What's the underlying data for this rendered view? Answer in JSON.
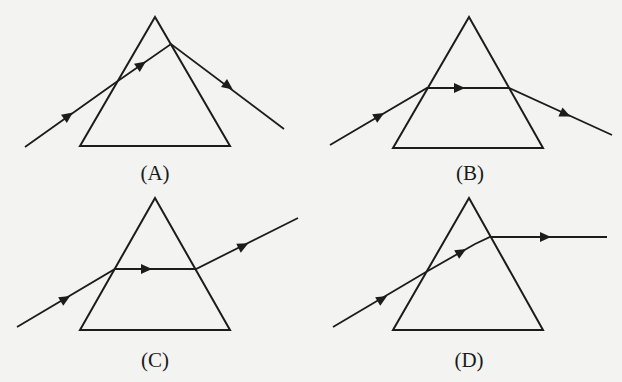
{
  "diagram": {
    "type": "prism-ray-refraction-options",
    "colors": {
      "background": "#f3f3f1",
      "ink": "#1c1c1c"
    },
    "panels": [
      {
        "id": "A",
        "label": "(A)",
        "label_pos": [
          155,
          180
        ],
        "prism": [
          [
            155,
            17
          ],
          [
            80,
            146
          ],
          [
            230,
            146
          ]
        ],
        "ray": [
          [
            25,
            147
          ],
          [
            115,
            83
          ],
          [
            171,
            44
          ],
          [
            284,
            129
          ]
        ],
        "arrows": [
          {
            "at": [
              68,
              116
            ],
            "dir": [
              90,
              -64
            ]
          },
          {
            "at": [
              141,
              65
            ],
            "dir": [
              56,
              -39
            ]
          },
          {
            "at": [
              228,
              86
            ],
            "dir": [
              113,
              85
            ]
          }
        ]
      },
      {
        "id": "B",
        "label": "(B)",
        "label_pos": [
          470,
          180
        ],
        "prism": [
          [
            469,
            17
          ],
          [
            393,
            148
          ],
          [
            543,
            148
          ]
        ],
        "ray": [
          [
            330,
            145
          ],
          [
            427,
            88
          ],
          [
            509,
            88
          ],
          [
            612,
            135
          ]
        ],
        "arrows": [
          {
            "at": [
              379,
              116
            ],
            "dir": [
              97,
              -57
            ]
          },
          {
            "at": [
              459,
              88
            ],
            "dir": [
              1,
              0
            ]
          },
          {
            "at": [
              565,
              114
            ],
            "dir": [
              103,
              47
            ]
          }
        ]
      },
      {
        "id": "C",
        "label": "(C)",
        "label_pos": [
          155,
          367
        ],
        "prism": [
          [
            155,
            198
          ],
          [
            80,
            330
          ],
          [
            230,
            330
          ]
        ],
        "ray": [
          [
            17,
            327
          ],
          [
            115,
            269
          ],
          [
            196,
            269
          ],
          [
            298,
            218
          ]
        ],
        "arrows": [
          {
            "at": [
              65,
              299
            ],
            "dir": [
              98,
              -58
            ]
          },
          {
            "at": [
              146,
              269
            ],
            "dir": [
              1,
              0
            ]
          },
          {
            "at": [
              243,
              246
            ],
            "dir": [
              102,
              -51
            ]
          }
        ]
      },
      {
        "id": "D",
        "label": "(D)",
        "label_pos": [
          469,
          367
        ],
        "prism": [
          [
            469,
            198
          ],
          [
            393,
            330
          ],
          [
            543,
            330
          ]
        ],
        "ray": [
          [
            333,
            327
          ],
          [
            426,
            272
          ],
          [
            475,
            244
          ],
          [
            490,
            237
          ],
          [
            607,
            237
          ]
        ],
        "arrows": [
          {
            "at": [
              382,
              299
            ],
            "dir": [
              93,
              -55
            ]
          },
          {
            "at": [
              461,
              252
            ],
            "dir": [
              49,
              -28
            ]
          },
          {
            "at": [
              545,
              237
            ],
            "dir": [
              1,
              0
            ]
          }
        ]
      }
    ]
  }
}
